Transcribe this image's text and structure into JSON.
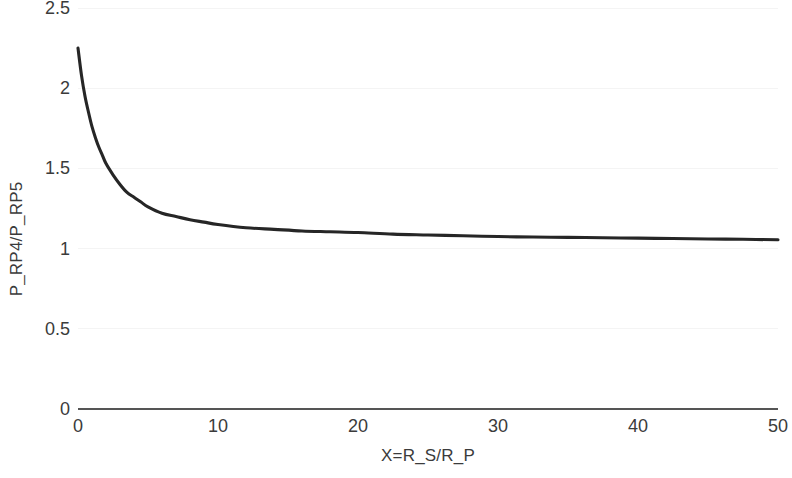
{
  "chart_data": {
    "type": "line",
    "title": "",
    "xlabel": "X=R_S/R_P",
    "ylabel": "P_RP4/P_RP5",
    "xlim": [
      0,
      50
    ],
    "ylim": [
      0,
      2.5
    ],
    "xticks": [
      "0",
      "10",
      "20",
      "30",
      "40",
      "50"
    ],
    "xtick_values": [
      0,
      10,
      20,
      30,
      40,
      50
    ],
    "yticks": [
      "0",
      "0.5",
      "1",
      "1.5",
      "2",
      "2.5"
    ],
    "ytick_values": [
      0,
      0.5,
      1,
      1.5,
      2,
      2.5
    ],
    "grid": true,
    "grid_axis": "y",
    "legend": null,
    "series": [
      {
        "name": "P_RP4/P_RP5",
        "color": "#262626",
        "x": [
          0,
          0.25,
          0.5,
          0.75,
          1,
          1.25,
          1.5,
          1.75,
          2,
          2.5,
          3,
          3.5,
          4,
          4.5,
          5,
          6,
          7,
          8,
          9,
          10,
          12,
          14,
          16,
          18,
          20,
          22.5,
          25,
          27.5,
          30,
          32.5,
          35,
          37.5,
          40,
          42.5,
          45,
          47.5,
          50
        ],
        "y": [
          2.25,
          2.08,
          1.95,
          1.85,
          1.76,
          1.69,
          1.63,
          1.58,
          1.53,
          1.46,
          1.4,
          1.35,
          1.32,
          1.29,
          1.26,
          1.22,
          1.2,
          1.18,
          1.165,
          1.15,
          1.13,
          1.12,
          1.11,
          1.105,
          1.1,
          1.09,
          1.085,
          1.08,
          1.075,
          1.072,
          1.07,
          1.068,
          1.065,
          1.063,
          1.06,
          1.058,
          1.055
        ]
      }
    ]
  },
  "axes": {
    "x_title": "X=R_S/R_P",
    "y_title": "P_RP4/P_RP5"
  },
  "colors": {
    "curve": "#262626",
    "axis": "#555555",
    "grid": "#f4f4f4",
    "text": "#3b3b3b",
    "background": "#ffffff"
  }
}
